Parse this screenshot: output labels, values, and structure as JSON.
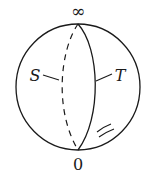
{
  "diagram": {
    "type": "riemann-sphere",
    "labels": {
      "top": "∞",
      "bottom": "0",
      "left": "S",
      "right": "T"
    },
    "elements": {
      "sphere": "circle outline",
      "back_meridian": "dashed arc labeled S",
      "front_meridian": "solid arc labeled T",
      "hatch_marks": "two short parallel strokes near lower right"
    },
    "colors": {
      "stroke": "#1a1a1a",
      "background": "#ffffff"
    }
  }
}
